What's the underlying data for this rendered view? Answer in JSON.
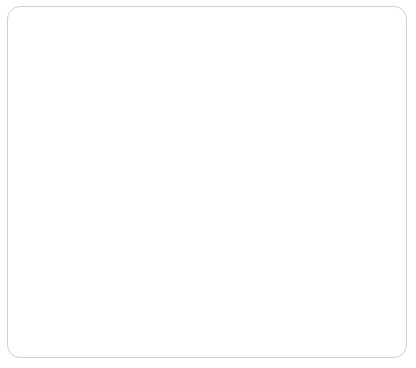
{
  "chart_data": {
    "type": "line",
    "title": "",
    "subtitle": "",
    "xlabel": "",
    "ylabel": "",
    "categories": [
      "2012",
      "2013",
      "2014",
      "2015",
      "2016",
      "2017",
      "2018",
      "2019",
      "2020",
      "2021"
    ],
    "values": [
      96.99,
      97.76,
      98.93,
      98.63,
      100,
      100.62,
      101.98,
      102.55,
      102.31,
      104.32
    ],
    "point_labels": [
      "96.99",
      "97.76",
      "98.93",
      "98.63",
      "100",
      "100.62",
      "101.98",
      "102.55",
      "102.31",
      "104.32"
    ],
    "ylim": [
      96,
      105
    ],
    "y_ticks": [
      96,
      97,
      98,
      99,
      100,
      101,
      102,
      103,
      104,
      105
    ],
    "y_tick_labels": [
      "96",
      "97",
      "98",
      "99",
      "100",
      "101",
      "102",
      "103",
      "104",
      "105"
    ],
    "x_tick_labels": [
      "2012",
      "2013",
      "2014",
      "2015",
      "2016",
      "2017",
      "2018",
      "2019",
      "2020",
      "2021"
    ],
    "grid": true,
    "grid_x": true,
    "grid_y": true,
    "legend": false,
    "legend_position": "none",
    "series": [
      {
        "name": "index",
        "values": [
          96.99,
          97.76,
          98.93,
          98.63,
          100,
          100.62,
          101.98,
          102.55,
          102.31,
          104.32
        ]
      }
    ],
    "colors": {
      "line": "#8c8c8c",
      "marker": "#1c1c1c",
      "grid": "#d6d6d6",
      "axis": "#9a9a9a",
      "frame": "#cfcfcf",
      "background": "#ffffff",
      "label_text": "#1f1f1f",
      "tick_text": "#3b3b3b"
    }
  }
}
